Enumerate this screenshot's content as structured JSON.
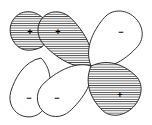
{
  "figure": {
    "kind": "molecular-orbital-lobe-diagram",
    "width": 152,
    "height": 125,
    "background_color": "#ffffff",
    "stroke_color": "#1a1a1a",
    "hatch_color": "#1a1a1a",
    "hatch_spacing_px": 2.3,
    "hatch_orientation": "horizontal"
  },
  "nodes": [
    {
      "name": "central-node",
      "x": 91,
      "y": 66
    },
    {
      "name": "upper-left-node",
      "x": 42,
      "y": 47
    },
    {
      "name": "lower-left-node",
      "x": 41,
      "y": 58
    }
  ],
  "lobes": [
    {
      "id": "lobe-upper-left",
      "sign": "+",
      "shaded": true,
      "label_x": 30,
      "label_y": 32,
      "tip_x": 42,
      "tip_y": 47,
      "bulb_cx": 30,
      "bulb_cy": 32,
      "bulb_rx": 19,
      "bulb_ry": 21,
      "angle_deg": 230
    },
    {
      "id": "lobe-upper-middle",
      "sign": "+",
      "shaded": true,
      "label_x": 58,
      "label_y": 32,
      "tip_x": 91,
      "tip_y": 66,
      "bulb_cx": 58,
      "bulb_cy": 32,
      "bulb_rx": 19,
      "bulb_ry": 21,
      "angle_deg": 225
    },
    {
      "id": "lobe-upper-right",
      "sign": "−",
      "shaded": false,
      "label_x": 121,
      "label_y": 32,
      "tip_x": 91,
      "tip_y": 66,
      "bulb_cx": 121,
      "bulb_cy": 32,
      "bulb_rx": 22,
      "bulb_ry": 20,
      "angle_deg": 315
    },
    {
      "id": "lobe-lower-left",
      "sign": "−",
      "shaded": false,
      "label_x": 29,
      "label_y": 98,
      "tip_x": 41,
      "tip_y": 58,
      "bulb_cx": 29,
      "bulb_cy": 97,
      "bulb_rx": 19,
      "bulb_ry": 20,
      "angle_deg": 130
    },
    {
      "id": "lobe-lower-middle",
      "sign": "−",
      "shaded": false,
      "label_x": 57,
      "label_y": 98,
      "tip_x": 91,
      "tip_y": 66,
      "bulb_cx": 57,
      "bulb_cy": 97,
      "bulb_rx": 19,
      "bulb_ry": 20,
      "angle_deg": 135
    },
    {
      "id": "lobe-lower-right",
      "sign": "+",
      "shaded": true,
      "label_x": 120,
      "label_y": 95,
      "tip_x": 91,
      "tip_y": 66,
      "bulb_cx": 119,
      "bulb_cy": 93,
      "bulb_rx": 24,
      "bulb_ry": 20,
      "angle_deg": 45
    }
  ],
  "legend": {
    "positive_symbol": "+",
    "negative_symbol": "−",
    "shaded_means": "positive phase",
    "unshaded_means": "negative phase"
  }
}
